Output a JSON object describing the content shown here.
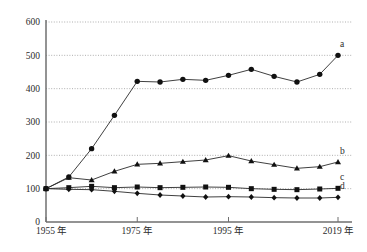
{
  "chart_data": {
    "type": "line",
    "title": "",
    "xlabel": "",
    "ylabel": "",
    "xlim": [
      1955,
      2019
    ],
    "ylim": [
      0,
      600
    ],
    "ytick_values": [
      0,
      100,
      200,
      300,
      400,
      500,
      600
    ],
    "ytick_labels": [
      "0",
      "100",
      "200",
      "300",
      "400",
      "500",
      "600"
    ],
    "xtick_values": [
      1955,
      1975,
      1995,
      2019
    ],
    "xtick_labels": [
      "1955 年",
      "1975 年",
      "1995 年",
      "2019 年"
    ],
    "grid": "horizontal-dotted",
    "legend_position": "right-inline",
    "x": [
      1955,
      1960,
      1965,
      1970,
      1975,
      1980,
      1985,
      1990,
      1995,
      2000,
      2005,
      2010,
      2015,
      2019
    ],
    "series": [
      {
        "name": "a",
        "label": "a",
        "marker": "circle",
        "values": [
          100,
          135,
          220,
          320,
          422,
          420,
          428,
          425,
          440,
          458,
          437,
          420,
          443,
          500
        ]
      },
      {
        "name": "b",
        "label": "b",
        "marker": "triangle",
        "values": [
          100,
          133,
          126,
          152,
          173,
          176,
          181,
          186,
          199,
          183,
          172,
          161,
          166,
          180
        ]
      },
      {
        "name": "c",
        "label": "c",
        "marker": "square",
        "values": [
          100,
          103,
          107,
          103,
          105,
          103,
          104,
          105,
          104,
          100,
          98,
          97,
          99,
          101
        ]
      },
      {
        "name": "d",
        "label": "d",
        "marker": "diamond",
        "values": [
          100,
          98,
          97,
          92,
          86,
          81,
          78,
          75,
          76,
          75,
          73,
          72,
          72,
          74
        ]
      }
    ]
  },
  "footnote": ""
}
